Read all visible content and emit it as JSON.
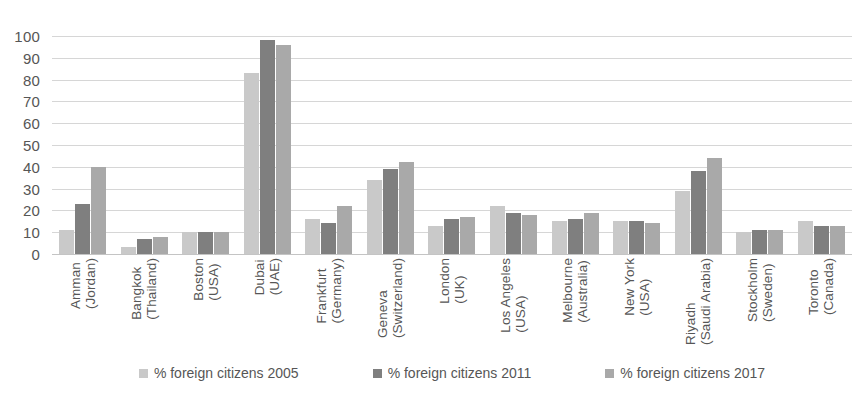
{
  "chart_data": {
    "type": "bar",
    "title": "",
    "subtitle": "",
    "xlabel": "",
    "ylabel": "",
    "ylim": [
      0,
      100
    ],
    "yticks": [
      0,
      10,
      20,
      30,
      40,
      50,
      60,
      70,
      80,
      90,
      100
    ],
    "ytick_labels": [
      "0",
      "10",
      "20",
      "30",
      "40",
      "50",
      "60",
      "70",
      "80",
      "90",
      "100"
    ],
    "grid": true,
    "legend_position": "bottom",
    "categories": [
      "Amman (Jordan)",
      "Bangkok (Thailand)",
      "Boston (USA)",
      "Dubai (UAE)",
      "Frankfurt (Germany)",
      "Geneva (Switzerland)",
      "London (UK)",
      "Los Angeles (USA)",
      "Melbourne (Australia)",
      "New York (USA)",
      "Riyadh (Saudi Arabia)",
      "Stockholm (Sweden)",
      "Toronto (Canada)"
    ],
    "category_lines": [
      [
        "Amman",
        "(Jordan)"
      ],
      [
        "Bangkok",
        "(Thailand)"
      ],
      [
        "Boston",
        "(USA)"
      ],
      [
        "Dubai",
        "(UAE)"
      ],
      [
        "Frankfurt",
        "(Germany)"
      ],
      [
        "Geneva",
        "(Switzerland)"
      ],
      [
        "London",
        "(UK)"
      ],
      [
        "Los Angeles",
        "(USA)"
      ],
      [
        "Melbourne",
        "(Australia)"
      ],
      [
        "New York",
        "(USA)"
      ],
      [
        "Riyadh",
        "(Saudi Arabia)"
      ],
      [
        "Stockholm",
        "(Sweden)"
      ],
      [
        "Toronto",
        "(Canada)"
      ]
    ],
    "series": [
      {
        "name": "% foreign citizens 2005",
        "color": "#c9c9c9",
        "values": [
          11,
          3,
          10,
          83,
          16,
          34,
          13,
          22,
          15,
          15,
          29,
          10,
          15
        ]
      },
      {
        "name": "% foreign citizens 2011",
        "color": "#7f7f7f",
        "values": [
          23,
          7,
          10,
          98,
          14,
          39,
          16,
          19,
          16,
          15,
          38,
          11,
          13
        ]
      },
      {
        "name": "% foreign citizens 2017",
        "color": "#a9a9a9",
        "values": [
          40,
          8,
          10,
          96,
          22,
          42,
          17,
          18,
          19,
          14,
          44,
          11,
          13
        ]
      }
    ]
  },
  "legend": {
    "items": [
      {
        "label": "% foreign citizens 2005",
        "color": "#c9c9c9"
      },
      {
        "label": "% foreign citizens 2011",
        "color": "#7f7f7f"
      },
      {
        "label": "% foreign citizens 2017",
        "color": "#a9a9a9"
      }
    ]
  },
  "colors": {
    "background": "#ffffff",
    "gridline": "#d6d6d6",
    "baseline": "#c4c4c4",
    "text": "#565656"
  }
}
